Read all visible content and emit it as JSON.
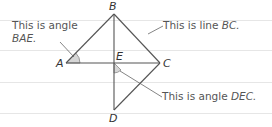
{
  "diagram": {
    "points": {
      "A": {
        "label": "A",
        "x": 66,
        "y": 63
      },
      "B": {
        "label": "B",
        "x": 114,
        "y": 14
      },
      "C": {
        "label": "C",
        "x": 160,
        "y": 63
      },
      "D": {
        "label": "D",
        "x": 114,
        "y": 110
      },
      "E": {
        "label": "E",
        "x": 114,
        "y": 63
      }
    },
    "segments": [
      "AB",
      "BC",
      "BD",
      "AC",
      "CD"
    ],
    "callouts": {
      "angle_bae": {
        "prefix": "This is angle",
        "name": "BAE."
      },
      "line_bc": {
        "prefix": "This is line ",
        "name": "BC."
      },
      "angle_dec": {
        "prefix": "This is angle ",
        "name": "DEC."
      }
    },
    "colors": {
      "line": "#555555",
      "shade": "#d6d6d6",
      "ruled": "#e6e6e6",
      "text": "#555555"
    }
  }
}
